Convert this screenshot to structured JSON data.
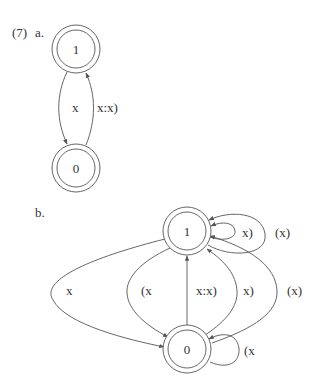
{
  "problem_label": "(7)",
  "part_a": {
    "label": "a.",
    "nodes": [
      {
        "id": "1",
        "label": "1",
        "accepting": true
      },
      {
        "id": "0",
        "label": "0",
        "accepting": true
      }
    ],
    "edges": [
      {
        "from": "1",
        "to": "0",
        "label": "x"
      },
      {
        "from": "0",
        "to": "1",
        "label": "x:x)"
      }
    ]
  },
  "part_b": {
    "label": "b.",
    "nodes": [
      {
        "id": "1",
        "label": "1",
        "accepting": true
      },
      {
        "id": "0",
        "label": "0",
        "accepting": true
      }
    ],
    "edges": [
      {
        "from": "1",
        "to": "1",
        "label": "x)",
        "kind": "self-loop-inner"
      },
      {
        "from": "1",
        "to": "1",
        "label": "(x)",
        "kind": "self-loop-outer"
      },
      {
        "from": "1",
        "to": "0",
        "label": "x",
        "kind": "outer-left-arc"
      },
      {
        "from": "1",
        "to": "0",
        "label": "(x",
        "kind": "inner-left-arc"
      },
      {
        "from": "0",
        "to": "1",
        "label": "x:x)",
        "kind": "straight"
      },
      {
        "from": "0",
        "to": "1",
        "label": "x)",
        "kind": "inner-right-arc"
      },
      {
        "from": "0",
        "to": "1",
        "label": "(x)",
        "kind": "outer-right-arc"
      },
      {
        "from": "0",
        "to": "0",
        "label": "(x",
        "kind": "self-loop"
      }
    ]
  },
  "colors": {
    "stroke": "#555555",
    "text": "#333333",
    "background": "#ffffff"
  }
}
